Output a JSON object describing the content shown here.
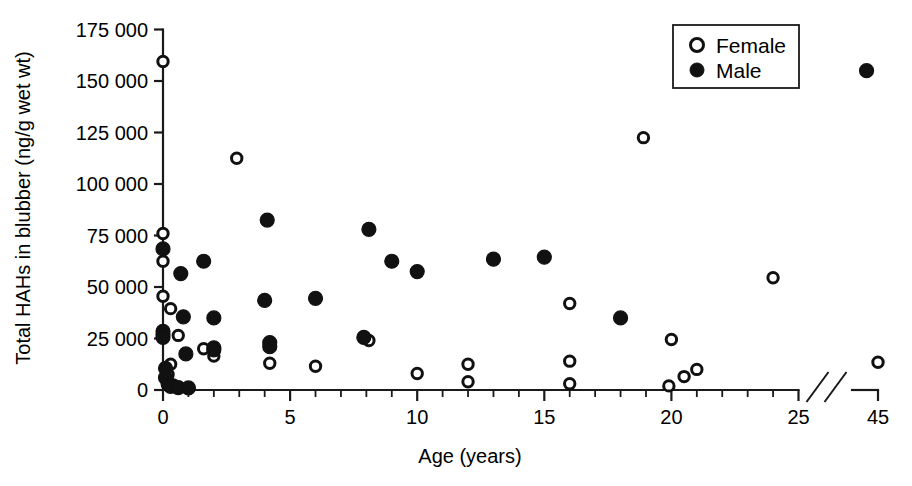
{
  "chart_data": {
    "type": "scatter",
    "title": "",
    "xlabel": "Age (years)",
    "ylabel": "Total HAHs in blubber (ng/g wet wt)",
    "xlim": [
      0,
      45
    ],
    "ylim": [
      0,
      175000
    ],
    "x_ticks_major": [
      0,
      5,
      10,
      15,
      20,
      25,
      45
    ],
    "x_tick_labels": [
      "0",
      "5",
      "10",
      "15",
      "20",
      "25",
      "45"
    ],
    "x_ticks_minor": [
      1,
      2,
      3,
      4,
      6,
      7,
      8,
      9,
      11,
      12,
      13,
      14,
      16,
      17,
      18,
      19,
      21,
      22,
      23,
      24
    ],
    "y_ticks": [
      0,
      25000,
      50000,
      75000,
      100000,
      125000,
      150000,
      175000
    ],
    "y_tick_labels": [
      "0",
      "25 000",
      "50 000",
      "75 000",
      "100 000",
      "125 000",
      "150 000",
      "175 000"
    ],
    "axis_break": {
      "after": 25,
      "before": 45,
      "style": "double-slash"
    },
    "grid": false,
    "legend_position": "top-right",
    "legend": [
      {
        "name": "Female",
        "marker": "open-circle"
      },
      {
        "name": "Male",
        "marker": "filled-circle"
      }
    ],
    "series": [
      {
        "name": "Female",
        "marker": "open-circle",
        "color": "#ffffff",
        "edge_color": "#111111",
        "points": [
          {
            "x": 0.0,
            "y": 159500
          },
          {
            "x": 0.0,
            "y": 76000
          },
          {
            "x": 0.0,
            "y": 62500
          },
          {
            "x": 0.0,
            "y": 45500
          },
          {
            "x": 0.3,
            "y": 39500
          },
          {
            "x": 0.6,
            "y": 26500
          },
          {
            "x": 0.3,
            "y": 12500
          },
          {
            "x": 0.2,
            "y": 7500
          },
          {
            "x": 0.2,
            "y": 4000
          },
          {
            "x": 0.4,
            "y": 2500
          },
          {
            "x": 1.6,
            "y": 20000
          },
          {
            "x": 2.0,
            "y": 16500
          },
          {
            "x": 2.9,
            "y": 112500
          },
          {
            "x": 4.2,
            "y": 13000
          },
          {
            "x": 6.0,
            "y": 11500
          },
          {
            "x": 8.1,
            "y": 24000
          },
          {
            "x": 10.0,
            "y": 8000
          },
          {
            "x": 12.0,
            "y": 12500
          },
          {
            "x": 12.0,
            "y": 4000
          },
          {
            "x": 16.0,
            "y": 42000
          },
          {
            "x": 16.0,
            "y": 14000
          },
          {
            "x": 16.0,
            "y": 3000
          },
          {
            "x": 18.9,
            "y": 122500
          },
          {
            "x": 20.0,
            "y": 24500
          },
          {
            "x": 19.9,
            "y": 2000
          },
          {
            "x": 20.5,
            "y": 6500
          },
          {
            "x": 21.0,
            "y": 10000
          },
          {
            "x": 24.0,
            "y": 54500
          },
          {
            "x": 45.0,
            "y": 13500
          }
        ]
      },
      {
        "name": "Male",
        "marker": "filled-circle",
        "color": "#111111",
        "edge_color": "#111111",
        "points": [
          {
            "x": 0.0,
            "y": 68500
          },
          {
            "x": 0.0,
            "y": 28500
          },
          {
            "x": 0.0,
            "y": 27000
          },
          {
            "x": 0.0,
            "y": 25500
          },
          {
            "x": 0.1,
            "y": 10500
          },
          {
            "x": 0.1,
            "y": 6000
          },
          {
            "x": 0.2,
            "y": 3000
          },
          {
            "x": 0.3,
            "y": 1800
          },
          {
            "x": 0.6,
            "y": 1200
          },
          {
            "x": 0.7,
            "y": 56500
          },
          {
            "x": 0.8,
            "y": 35500
          },
          {
            "x": 0.9,
            "y": 17500
          },
          {
            "x": 1.0,
            "y": 1000
          },
          {
            "x": 1.6,
            "y": 62500
          },
          {
            "x": 2.0,
            "y": 35000
          },
          {
            "x": 2.0,
            "y": 20500
          },
          {
            "x": 2.0,
            "y": 19500
          },
          {
            "x": 4.0,
            "y": 43500
          },
          {
            "x": 4.1,
            "y": 82500
          },
          {
            "x": 4.2,
            "y": 23000
          },
          {
            "x": 4.2,
            "y": 21000
          },
          {
            "x": 6.0,
            "y": 44500
          },
          {
            "x": 7.9,
            "y": 25500
          },
          {
            "x": 8.1,
            "y": 78000
          },
          {
            "x": 9.0,
            "y": 62500
          },
          {
            "x": 10.0,
            "y": 57500
          },
          {
            "x": 13.0,
            "y": 63500
          },
          {
            "x": 15.0,
            "y": 64500
          },
          {
            "x": 18.0,
            "y": 35000
          },
          {
            "x": 43.5,
            "y": 155000
          }
        ]
      }
    ]
  },
  "axis": {
    "x_title": "Age (years)",
    "y_title": "Total HAHs in blubber (ng/g wet wt)"
  }
}
